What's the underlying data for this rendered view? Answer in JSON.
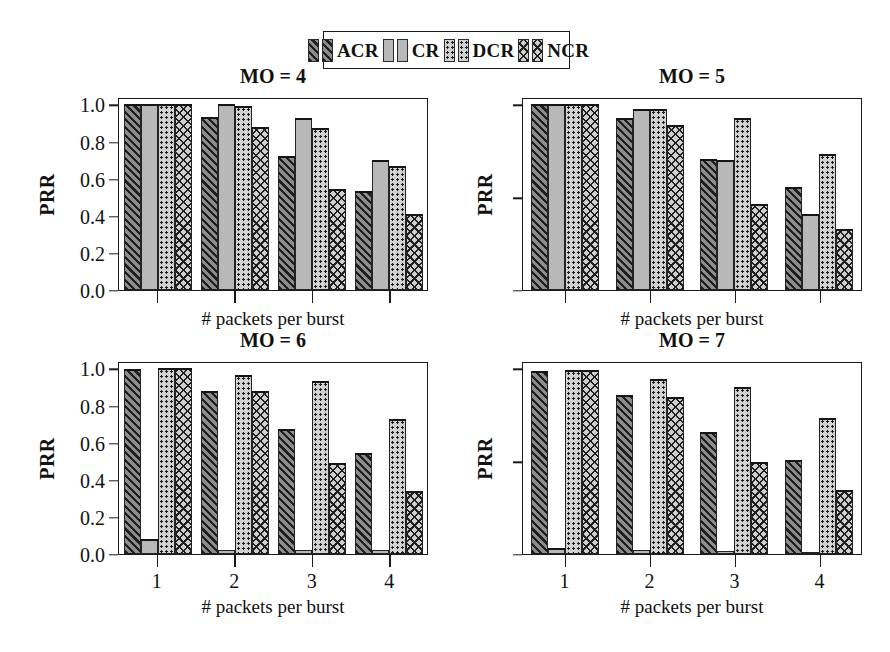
{
  "legend": {
    "items": [
      {
        "label": "ACR",
        "pattern": "diagonal-hatch",
        "color": "#8c8c8c"
      },
      {
        "label": "CR",
        "pattern": "solid-gray",
        "color": "#b8b8b8"
      },
      {
        "label": "DCR",
        "pattern": "dotted",
        "color": "#d2d2d2"
      },
      {
        "label": "NCR",
        "pattern": "crosshatch",
        "color": "#cfcfcf"
      }
    ]
  },
  "axes": {
    "ylabel": "PRR",
    "xlabel": "# packets per burst",
    "ytick_labels": [
      "0.0",
      "0.2",
      "0.4",
      "0.6",
      "0.8",
      "1.0"
    ],
    "ytick_values": [
      0.0,
      0.2,
      0.4,
      0.6,
      0.8,
      1.0
    ],
    "ylim": [
      0.0,
      1.04
    ],
    "xtick_labels": [
      "1",
      "2",
      "3",
      "4"
    ]
  },
  "panels": [
    {
      "title": "MO = 4",
      "show_ylabels": true,
      "show_xlabels": false,
      "ytick_sparse": false
    },
    {
      "title": "MO = 5",
      "show_ylabels": false,
      "show_xlabels": false,
      "ytick_sparse": true
    },
    {
      "title": "MO = 6",
      "show_ylabels": true,
      "show_xlabels": true,
      "ytick_sparse": false
    },
    {
      "title": "MO = 7",
      "show_ylabels": false,
      "show_xlabels": true,
      "ytick_sparse": true
    }
  ],
  "chart_data": [
    {
      "type": "bar",
      "title": "MO = 4",
      "xlabel": "# packets per burst",
      "ylabel": "PRR",
      "ylim": [
        0.0,
        1.04
      ],
      "categories": [
        "1",
        "2",
        "3",
        "4"
      ],
      "series": [
        {
          "name": "ACR",
          "values": [
            1.0,
            0.935,
            0.72,
            0.535
          ]
        },
        {
          "name": "CR",
          "values": [
            1.0,
            1.0,
            0.925,
            0.7
          ]
        },
        {
          "name": "DCR",
          "values": [
            1.0,
            0.99,
            0.875,
            0.67
          ]
        },
        {
          "name": "NCR",
          "values": [
            1.0,
            0.88,
            0.545,
            0.41
          ]
        }
      ]
    },
    {
      "type": "bar",
      "title": "MO = 5",
      "xlabel": "# packets per burst",
      "ylabel": "PRR",
      "ylim": [
        0.0,
        1.04
      ],
      "categories": [
        "1",
        "2",
        "3",
        "4"
      ],
      "series": [
        {
          "name": "ACR",
          "values": [
            1.0,
            0.925,
            0.705,
            0.555
          ]
        },
        {
          "name": "CR",
          "values": [
            1.0,
            0.975,
            0.7,
            0.41
          ]
        },
        {
          "name": "DCR",
          "values": [
            1.0,
            0.975,
            0.925,
            0.735
          ]
        },
        {
          "name": "NCR",
          "values": [
            1.0,
            0.89,
            0.465,
            0.33
          ]
        }
      ]
    },
    {
      "type": "bar",
      "title": "MO = 6",
      "xlabel": "# packets per burst",
      "ylabel": "PRR",
      "ylim": [
        0.0,
        1.04
      ],
      "categories": [
        "1",
        "2",
        "3",
        "4"
      ],
      "series": [
        {
          "name": "ACR",
          "values": [
            0.995,
            0.88,
            0.675,
            0.545
          ]
        },
        {
          "name": "CR",
          "values": [
            0.08,
            0.02,
            0.02,
            0.02
          ]
        },
        {
          "name": "DCR",
          "values": [
            1.0,
            0.965,
            0.93,
            0.73
          ]
        },
        {
          "name": "NCR",
          "values": [
            1.0,
            0.88,
            0.49,
            0.34
          ]
        }
      ]
    },
    {
      "type": "bar",
      "title": "MO = 7",
      "xlabel": "# packets per burst",
      "ylabel": "PRR",
      "ylim": [
        0.0,
        1.04
      ],
      "categories": [
        "1",
        "2",
        "3",
        "4"
      ],
      "series": [
        {
          "name": "ACR",
          "values": [
            0.985,
            0.855,
            0.655,
            0.505
          ]
        },
        {
          "name": "CR",
          "values": [
            0.035,
            0.022,
            0.015,
            0.01
          ]
        },
        {
          "name": "DCR",
          "values": [
            0.99,
            0.945,
            0.9,
            0.735
          ]
        },
        {
          "name": "NCR",
          "values": [
            0.99,
            0.845,
            0.495,
            0.345
          ]
        }
      ]
    }
  ]
}
